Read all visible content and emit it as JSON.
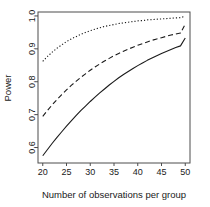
{
  "chart_data": {
    "type": "line",
    "title": "",
    "subtitle": "",
    "xlabel": "Number of observations per group",
    "ylabel": "Power",
    "xlim": [
      19.0,
      51.0
    ],
    "ylim": [
      0.553,
      1.012
    ],
    "xticks": [
      20,
      25,
      30,
      35,
      40,
      45,
      50
    ],
    "xticklabels": [
      "20",
      "25",
      "30",
      "35",
      "40",
      "45",
      "50"
    ],
    "yticks": [
      0.6,
      0.7,
      0.8,
      0.9,
      1.0
    ],
    "yticklabels": [
      "0.6",
      "0.7",
      "0.8",
      "0.9",
      "1.0"
    ],
    "grid": false,
    "legend": "none",
    "axis_color": "#4d4d4d",
    "line_color": "#1a1a1a",
    "x": [
      20,
      21,
      22,
      23,
      24,
      25,
      26,
      27,
      28,
      29,
      30,
      31,
      32,
      33,
      34,
      35,
      36,
      37,
      38,
      39,
      40,
      41,
      42,
      43,
      44,
      45,
      46,
      47,
      48,
      49,
      50
    ],
    "series": [
      {
        "name": "solid-curve",
        "linestyle": "solid",
        "dasharray": "none",
        "values": [
          0.575,
          0.594,
          0.613,
          0.631,
          0.648,
          0.665,
          0.681,
          0.697,
          0.712,
          0.726,
          0.74,
          0.753,
          0.766,
          0.778,
          0.79,
          0.801,
          0.812,
          0.822,
          0.831,
          0.84,
          0.849,
          0.857,
          0.865,
          0.872,
          0.879,
          0.886,
          0.892,
          0.898,
          0.904,
          0.909,
          0.933
        ]
      },
      {
        "name": "dashed-curve",
        "linestyle": "dashed",
        "dasharray": "5,3",
        "values": [
          0.695,
          0.713,
          0.73,
          0.746,
          0.761,
          0.775,
          0.789,
          0.801,
          0.813,
          0.824,
          0.835,
          0.845,
          0.854,
          0.863,
          0.871,
          0.879,
          0.886,
          0.893,
          0.899,
          0.905,
          0.911,
          0.916,
          0.921,
          0.926,
          0.93,
          0.934,
          0.938,
          0.942,
          0.945,
          0.948,
          0.975
        ]
      },
      {
        "name": "dotted-curve",
        "linestyle": "dotted",
        "dasharray": "1.2,2",
        "values": [
          0.862,
          0.877,
          0.89,
          0.902,
          0.912,
          0.922,
          0.93,
          0.937,
          0.944,
          0.95,
          0.955,
          0.96,
          0.964,
          0.968,
          0.971,
          0.974,
          0.977,
          0.979,
          0.981,
          0.983,
          0.985,
          0.986,
          0.988,
          0.989,
          0.99,
          0.991,
          0.992,
          0.993,
          0.994,
          0.995,
          0.999
        ]
      }
    ]
  },
  "plot": {
    "box": {
      "left": 38,
      "right": 190,
      "top": 12,
      "bottom": 163
    },
    "tick_length": 3
  }
}
